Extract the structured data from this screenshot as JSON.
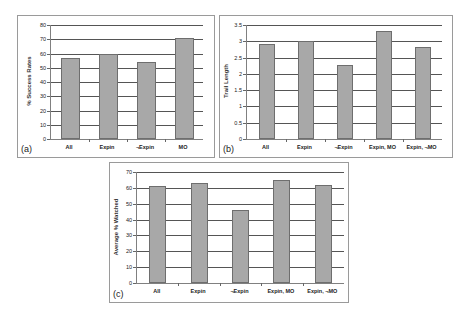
{
  "chart_data": [
    {
      "id": "a",
      "type": "bar",
      "panel_label": "(a)",
      "title": "",
      "xlabel": "",
      "ylabel": "% Success Rates",
      "categories": [
        "All",
        "Expin",
        "¬Expin",
        "MO"
      ],
      "values": [
        57,
        60,
        54,
        71
      ],
      "ylim": [
        0,
        80
      ],
      "yticks": [
        0,
        10,
        20,
        30,
        40,
        50,
        60,
        70,
        80
      ],
      "grid": true,
      "legend": null,
      "bar_color": "#a8a8a8"
    },
    {
      "id": "b",
      "type": "bar",
      "panel_label": "(b)",
      "title": "",
      "xlabel": "",
      "ylabel": "Trail Length",
      "categories": [
        "All",
        "Expin",
        "¬Expin",
        "Expin, MO",
        "Expin, ¬MO"
      ],
      "values": [
        2.93,
        3.0,
        2.27,
        3.33,
        2.83
      ],
      "ylim": [
        0,
        3.5
      ],
      "yticks": [
        0,
        0.5,
        1,
        1.5,
        2,
        2.5,
        3,
        3.5
      ],
      "grid": true,
      "legend": null,
      "bar_color": "#a8a8a8"
    },
    {
      "id": "c",
      "type": "bar",
      "panel_label": "(c)",
      "title": "",
      "xlabel": "",
      "ylabel": "Average % Watched",
      "categories": [
        "All",
        "Expin",
        "¬Expin",
        "Expin, MO",
        "Expin, ¬MO"
      ],
      "values": [
        61,
        63,
        46,
        65,
        62
      ],
      "ylim": [
        0,
        70
      ],
      "yticks": [
        0,
        10,
        20,
        30,
        40,
        50,
        60,
        70
      ],
      "grid": true,
      "legend": null,
      "bar_color": "#a8a8a8"
    }
  ]
}
